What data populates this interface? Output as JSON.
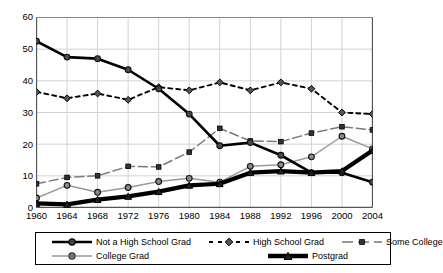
{
  "chart_data": {
    "type": "line",
    "title": "",
    "xlabel": "",
    "ylabel": "",
    "x": [
      1960,
      1964,
      1968,
      1972,
      1976,
      1980,
      1984,
      1988,
      1992,
      1996,
      2000,
      2004
    ],
    "categories": [
      "1960",
      "1964",
      "1968",
      "1972",
      "1976",
      "1980",
      "1984",
      "1988",
      "1992",
      "1996",
      "2000",
      "2004"
    ],
    "xticks": [
      "1960",
      "1964",
      "1968",
      "1972",
      "1976",
      "1980",
      "1984",
      "1988",
      "1992",
      "1996",
      "2000",
      "2004"
    ],
    "yticks": [
      "0",
      "10",
      "20",
      "30",
      "40",
      "50",
      "60"
    ],
    "ylim": [
      0,
      60
    ],
    "xlim": [
      1960,
      2004
    ],
    "grid": "vertical-and-horizontal",
    "legend_position": "bottom",
    "series": [
      {
        "name": "Not a High School Grad",
        "style": "solid-thick-black",
        "marker": "circle",
        "color": "#000000",
        "values": [
          52.5,
          47.5,
          47,
          43.5,
          37.5,
          29.5,
          19.5,
          20.5,
          16.5,
          11,
          11,
          8
        ]
      },
      {
        "name": "High School Grad",
        "style": "dashed-black",
        "marker": "diamond",
        "color": "#000000",
        "values": [
          36.5,
          34.5,
          36,
          34,
          38,
          37,
          39.5,
          37,
          39.5,
          37.5,
          30,
          29.5
        ]
      },
      {
        "name": "Some College",
        "style": "dashed-gray",
        "marker": "square",
        "color": "#666666",
        "values": [
          7.5,
          9.5,
          10,
          13,
          12.8,
          17.5,
          25,
          21,
          20.8,
          23.5,
          25.5,
          24.5
        ]
      },
      {
        "name": "College Grad",
        "style": "solid-gray",
        "marker": "circle",
        "color": "#808080",
        "values": [
          3,
          7,
          4.8,
          6.3,
          8.2,
          9.2,
          8,
          13,
          13.5,
          16,
          22.5,
          18.5
        ]
      },
      {
        "name": "Postgrad",
        "style": "solid-extra-thick-black",
        "marker": "triangle",
        "color": "#000000",
        "values": [
          1.3,
          1,
          2.5,
          3.5,
          5,
          7,
          7.5,
          11,
          11.5,
          11,
          11.5,
          18
        ]
      }
    ]
  },
  "legend": {
    "items": [
      {
        "label": "Not a High School Grad",
        "key": "solid-thick-circle"
      },
      {
        "label": "High School Grad",
        "key": "dashed-diamond"
      },
      {
        "label": "Some College",
        "key": "dashed-gray-square"
      },
      {
        "label": "College Grad",
        "key": "solid-gray-circle"
      },
      {
        "label": "Postgrad",
        "key": "solid-xthick-triangle"
      }
    ]
  }
}
